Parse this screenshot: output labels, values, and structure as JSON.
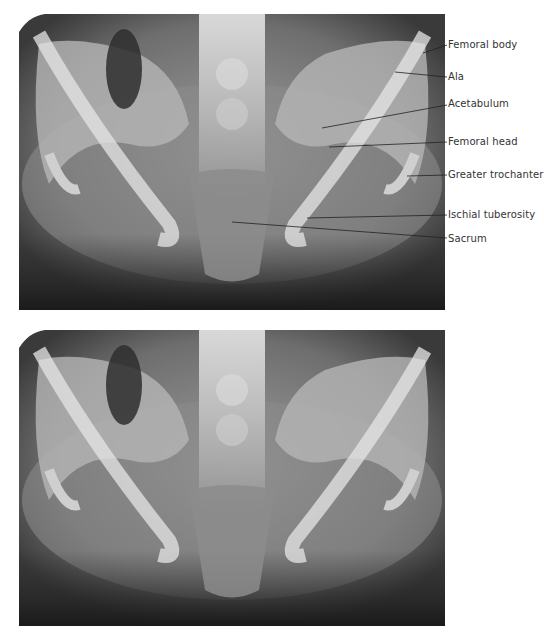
{
  "figure": {
    "panels": [
      {
        "id": "labeled",
        "description": "Anterior-posterior pelvic radiograph with anatomical labels"
      },
      {
        "id": "unlabeled",
        "description": "Same pelvic radiograph without labels"
      }
    ],
    "labels": [
      {
        "text": "Femoral body",
        "label_y": 39,
        "line": [
          423,
          53,
          445,
          45
        ]
      },
      {
        "text": "Ala",
        "label_y": 71,
        "line": [
          395,
          72,
          445,
          77
        ]
      },
      {
        "text": "Acetabulum",
        "label_y": 98,
        "line": [
          322,
          128,
          445,
          105
        ]
      },
      {
        "text": "Femoral head",
        "label_y": 136,
        "line": [
          329,
          147,
          445,
          142
        ]
      },
      {
        "text": "Greater trochanter",
        "label_y": 169,
        "line": [
          407,
          176,
          445,
          175
        ]
      },
      {
        "text": "Ischial tuberosity",
        "label_y": 209,
        "line": [
          307,
          218,
          445,
          215
        ]
      },
      {
        "text": "Sacrum",
        "label_y": 233,
        "line": [
          232,
          222,
          445,
          238
        ]
      }
    ]
  }
}
